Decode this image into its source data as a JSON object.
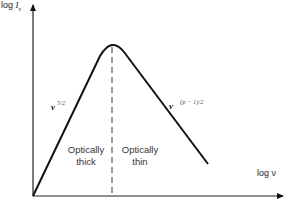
{
  "diagram": {
    "type": "synchrotron self-absorption spectrum",
    "y_axis_label_prefix": "log ",
    "y_axis_label_var": "I",
    "y_axis_label_sub": "ν",
    "x_axis_label": "log ν",
    "left_slope_base": "ν",
    "left_slope_exp": "5/2",
    "right_slope_base": "ν",
    "right_slope_exp": "(p − 1)/2",
    "region_left_line1": "Optically",
    "region_left_line2": "thick",
    "region_right_line1": "Optically",
    "region_right_line2": "thin",
    "line_color": "#111111"
  }
}
